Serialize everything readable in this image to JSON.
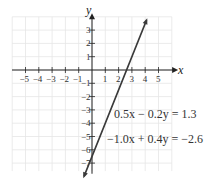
{
  "chart_data": {
    "type": "line",
    "title": "",
    "xlabel": "x",
    "ylabel": "y",
    "xlim": [
      -6,
      6
    ],
    "ylim": [
      -8,
      4
    ],
    "grid": true,
    "x_ticks": [
      "-5",
      "-4",
      "-3",
      "-2",
      "-1",
      "1",
      "2",
      "3",
      "4",
      "5"
    ],
    "y_ticks": [
      "3",
      "2",
      "1",
      "-1",
      "-2",
      "-3",
      "-4",
      "-5",
      "-6",
      "-7"
    ],
    "series": [
      {
        "name": "0.5x - 0.2y = 1.3",
        "equation_alt": "-1.0x + 0.4y = -2.6",
        "slope": 2.5,
        "intercept": -6.5,
        "x": [
          -0.6,
          4.1
        ],
        "y": [
          -8.0,
          3.75
        ]
      }
    ],
    "annotations": [
      "0.5x − 0.2y = 1.3",
      "−1.0x + 0.4y = −2.6"
    ]
  },
  "labels": {
    "x_axis": "x",
    "y_axis": "y",
    "eq1": "0.5x − 0.2y = 1.3",
    "eq2": "−1.0x + 0.4y = −2.6"
  },
  "colors": {
    "line": "#3a3a3a",
    "grid": "#e6e6e6",
    "axis": "#222222"
  }
}
